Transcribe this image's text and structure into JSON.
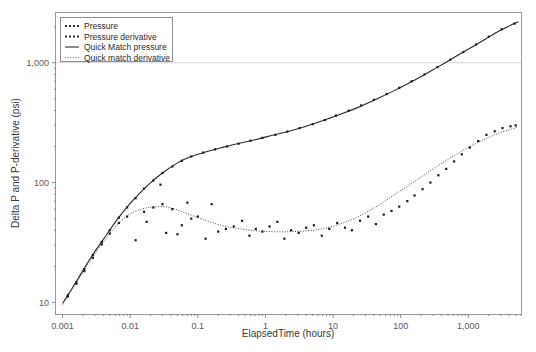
{
  "chart_data": {
    "type": "scatter",
    "title": "",
    "xlabel": "ElapsedTime (hours)",
    "ylabel": "Delta P and P-derivative (psi)",
    "xscale": "log",
    "yscale": "log",
    "xlim": [
      0.0008,
      6000
    ],
    "ylim": [
      8,
      2600
    ],
    "xticks": [
      0.001,
      0.01,
      0.1,
      1,
      10,
      100,
      1000
    ],
    "xticklabels": [
      "0.001",
      "0.01",
      "0.1",
      "1",
      "10",
      "100",
      "1,000"
    ],
    "yticks": [
      10,
      100,
      1000
    ],
    "yticklabels": [
      "10",
      "100",
      "1,000"
    ],
    "grid": "horizontal-at-1000-only",
    "legend_position": "top-left-inside",
    "legend": [
      {
        "label": "Pressure",
        "style": "dotted-marker",
        "color": "#2a2a2a"
      },
      {
        "label": "Pressure derivative",
        "style": "dotted-marker",
        "color": "#2a2a2a"
      },
      {
        "label": "Quick Match pressure",
        "style": "solid-line",
        "color": "#2a2a2a"
      },
      {
        "label": "Quick match derivative",
        "style": "dotted-line",
        "color": "#777777"
      }
    ],
    "series": [
      {
        "name": "Quick Match pressure",
        "style": "solid-line",
        "x": [
          0.001,
          0.0013,
          0.0017,
          0.0022,
          0.003,
          0.004,
          0.0055,
          0.0075,
          0.01,
          0.014,
          0.019,
          0.026,
          0.035,
          0.05,
          0.07,
          0.1,
          0.15,
          0.22,
          0.32,
          0.5,
          0.75,
          1.1,
          1.7,
          2.6,
          4,
          6,
          9,
          14,
          22,
          34,
          52,
          80,
          125,
          195,
          300,
          470,
          730,
          1150,
          1800,
          2800,
          4400,
          5500
        ],
        "y": [
          9.8,
          12.4,
          15.8,
          20.2,
          26.5,
          33.5,
          43.5,
          55,
          67,
          82,
          97,
          113,
          128,
          146,
          160,
          172,
          184,
          195,
          206,
          218,
          230,
          243,
          258,
          275,
          295,
          318,
          345,
          378,
          418,
          465,
          520,
          585,
          665,
          760,
          875,
          1010,
          1170,
          1360,
          1580,
          1830,
          2080,
          2200
        ]
      },
      {
        "name": "Quick match derivative",
        "style": "dotted-line",
        "x": [
          0.001,
          0.0013,
          0.0017,
          0.0022,
          0.003,
          0.004,
          0.0055,
          0.0075,
          0.01,
          0.014,
          0.019,
          0.026,
          0.035,
          0.05,
          0.07,
          0.1,
          0.15,
          0.22,
          0.32,
          0.5,
          0.75,
          1.1,
          1.7,
          2.6,
          4,
          6,
          9,
          14,
          22,
          34,
          52,
          80,
          125,
          195,
          300,
          470,
          730,
          1150,
          1800,
          2800,
          4400,
          5500
        ],
        "y": [
          9.6,
          12.1,
          15.3,
          19.5,
          25.4,
          31.8,
          40.2,
          48.5,
          55,
          59.5,
          62,
          63,
          62.5,
          59,
          55,
          51,
          47,
          44,
          42,
          40.5,
          39.5,
          39,
          38.8,
          39,
          39.5,
          40.5,
          42.5,
          46,
          51,
          58,
          67,
          79,
          93,
          110,
          130,
          153,
          178,
          205,
          232,
          258,
          280,
          292
        ]
      },
      {
        "name": "Pressure",
        "style": "markers",
        "x": [
          0.0012,
          0.0016,
          0.0021,
          0.0028,
          0.0038,
          0.005,
          0.0068,
          0.009,
          0.012,
          0.016,
          0.022,
          0.03,
          0.042,
          0.058,
          0.08,
          0.12,
          0.18,
          0.27,
          0.4,
          0.6,
          0.9,
          1.4,
          2.1,
          3.2,
          5,
          7.5,
          11,
          17,
          26,
          40,
          62,
          95,
          145,
          225,
          350,
          540,
          840,
          1300,
          2000,
          3100,
          4800
        ],
        "y": [
          11.5,
          14.7,
          18.9,
          24.8,
          32,
          40,
          51,
          62,
          74,
          89,
          104,
          120,
          136,
          152,
          165,
          178,
          189,
          200,
          211,
          223,
          236,
          250,
          266,
          285,
          307,
          332,
          362,
          398,
          440,
          490,
          548,
          618,
          700,
          800,
          920,
          1060,
          1225,
          1420,
          1650,
          1900,
          2120
        ]
      },
      {
        "name": "Pressure derivative",
        "style": "markers",
        "x": [
          0.0012,
          0.0016,
          0.0021,
          0.0028,
          0.0038,
          0.005,
          0.0068,
          0.009,
          0.012,
          0.016,
          0.0175,
          0.022,
          0.028,
          0.03,
          0.034,
          0.042,
          0.05,
          0.058,
          0.07,
          0.08,
          0.1,
          0.13,
          0.16,
          0.2,
          0.26,
          0.34,
          0.45,
          0.58,
          0.72,
          0.9,
          1.15,
          1.5,
          1.9,
          2.4,
          3.1,
          4,
          5.2,
          6.8,
          8.8,
          11.5,
          15,
          19,
          25,
          33,
          43,
          56,
          73,
          95,
          125,
          160,
          210,
          275,
          360,
          470,
          615,
          800,
          1050,
          1400,
          1850,
          2450,
          3200,
          4200,
          5000
        ],
        "y": [
          11.2,
          14.3,
          18.2,
          23.5,
          30.5,
          37.5,
          46,
          52,
          33,
          57,
          47,
          62,
          96,
          66,
          38,
          60,
          37,
          44,
          68,
          50,
          52,
          34,
          66,
          39,
          41,
          43,
          48,
          36,
          41,
          39,
          43,
          47,
          34,
          40,
          38,
          42,
          44,
          36,
          41,
          46,
          42,
          40,
          48,
          52,
          45,
          54,
          58,
          63,
          70,
          78,
          88,
          100,
          115,
          130,
          150,
          172,
          196,
          222,
          250,
          268,
          285,
          295,
          300
        ]
      }
    ]
  }
}
